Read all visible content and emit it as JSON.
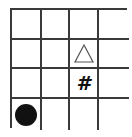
{
  "board": {
    "rows": 4,
    "cols": 4,
    "grid_color": "#3a3a3a",
    "cells": [
      [
        "",
        "",
        "",
        ""
      ],
      [
        "",
        "",
        "triangle",
        ""
      ],
      [
        "",
        "",
        "hash",
        ""
      ],
      [
        "circle",
        "",
        "",
        ""
      ]
    ],
    "pieces": [
      {
        "type": "triangle-outline-icon",
        "row": 1,
        "col": 2,
        "color": "#555555"
      },
      {
        "type": "hash-symbol",
        "row": 2,
        "col": 2,
        "symbol": "#",
        "color": "#111111"
      },
      {
        "type": "black-circle-icon",
        "row": 3,
        "col": 0,
        "color": "#111111"
      }
    ]
  }
}
